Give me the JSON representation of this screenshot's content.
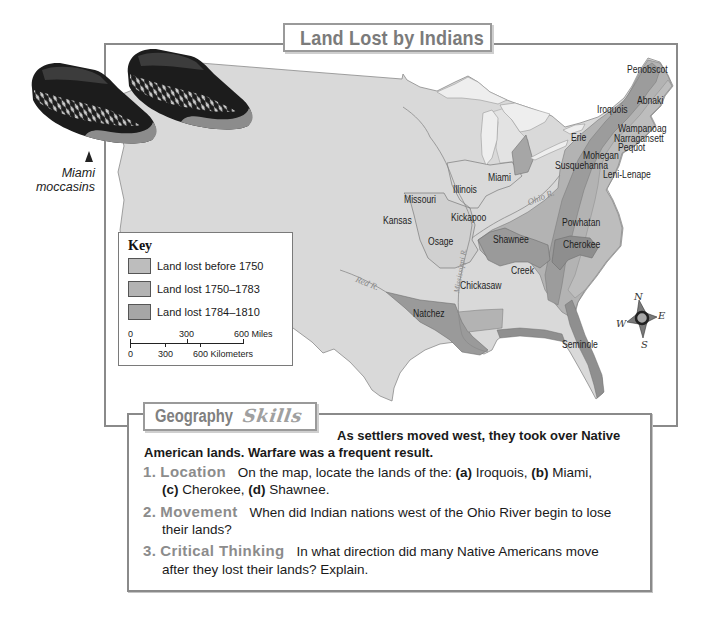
{
  "map": {
    "title": "Land Lost by Indians",
    "tribes": [
      "Penobscot",
      "Abnaki",
      "Iroquois",
      "Wampanoag",
      "Narragansett",
      "Pequot",
      "Erie",
      "Mohegan",
      "Susquehanna",
      "Leni-Lenape",
      "Miami",
      "Illinois",
      "Missouri",
      "Kansas",
      "Kickapoo",
      "Osage",
      "Shawnee",
      "Powhatan",
      "Cherokee",
      "Creek",
      "Chickasaw",
      "Natchez",
      "Seminole"
    ],
    "rivers": {
      "red": "Red R.",
      "ohio": "Ohio R.",
      "mississippi": "Mississippi R."
    },
    "compass": {
      "n": "N",
      "e": "E",
      "s": "S",
      "w": "W"
    },
    "colors": {
      "land": "#d9d9d9",
      "lakes": "#eeeeee",
      "lost_before_1750": "#bdbdbd",
      "lost_1750_1783": "#b3b3b3",
      "lost_1784_1810": "#a6a6a6",
      "frame": "#8a8a8a"
    },
    "key": {
      "heading": "Key",
      "items": [
        {
          "label": "Land lost before 1750",
          "color": "#bdbdbd"
        },
        {
          "label": "Land lost 1750–1783",
          "color": "#b3b3b3"
        },
        {
          "label": "Land lost 1784–1810",
          "color": "#a6a6a6"
        }
      ],
      "scale_miles": {
        "zero": "0",
        "mid": "300",
        "end": "600 Miles"
      },
      "scale_km": {
        "zero": "0",
        "mid": "300",
        "end": "600 Kilometers"
      }
    }
  },
  "photo_caption": {
    "line1": "Miami",
    "line2": "moccasins"
  },
  "skills": {
    "tab_label": "Geography",
    "tab_label_script": "Skills",
    "intro_line1": "As settlers moved west, they took over Native",
    "intro_line2": "American lands. Warfare was a frequent result.",
    "questions": [
      {
        "number": "1.",
        "label": "Location",
        "prompt": "On the map, locate the lands of the:",
        "parts": [
          {
            "letter": "(a)",
            "name": "Iroquois,"
          },
          {
            "letter": "(b)",
            "name": "Miami,"
          },
          {
            "letter": "(c)",
            "name": "Cherokee,"
          },
          {
            "letter": "(d)",
            "name": "Shawnee."
          }
        ]
      },
      {
        "number": "2.",
        "label": "Movement",
        "line1": "When did Indian nations west of the Ohio River begin to lose",
        "line2": "their lands?"
      },
      {
        "number": "3.",
        "label": "Critical Thinking",
        "line1": "In what direction did many Native Americans move",
        "line2": "after they lost their lands? Explain."
      }
    ]
  }
}
